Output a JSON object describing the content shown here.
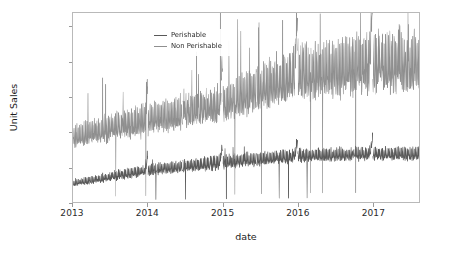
{
  "chart_data": {
    "type": "line",
    "title": "",
    "xlabel": "date",
    "ylabel": "Unit Sales",
    "grid": false,
    "legend_position": "upper-left-inside",
    "xlim": [
      "2013-01-01",
      "2017-08-15"
    ],
    "ylim": [
      0,
      1080000
    ],
    "yticks": [
      0,
      200000,
      400000,
      600000,
      800000,
      1000000
    ],
    "ytick_labels": [
      "0",
      "200000",
      "400000",
      "600000",
      "800000",
      "1000000"
    ],
    "xticks": [
      "2013",
      "2014",
      "2015",
      "2016",
      "2017"
    ],
    "xtick_labels": [
      "2013",
      "2014",
      "2015",
      "2016",
      "2017"
    ],
    "series": [
      {
        "name": "Perishable",
        "color": "#595959",
        "linewidth": 0.7,
        "description": "Daily perishable unit sales; low band rising in steps across years with occasional zero-drop gaps.",
        "yearly_band": [
          {
            "year": 2013,
            "low": 70000,
            "high": 125000,
            "mean": 95000
          },
          {
            "year": 2014,
            "low": 120000,
            "high": 215000,
            "mean": 165000
          },
          {
            "year": 2015,
            "low": 150000,
            "high": 265000,
            "mean": 205000
          },
          {
            "year": 2016,
            "low": 195000,
            "high": 300000,
            "mean": 248000
          },
          {
            "year": 2017,
            "low": 205000,
            "high": 310000,
            "mean": 262000
          }
        ]
      },
      {
        "name": "Non Perishable",
        "color": "#8f8f8f",
        "linewidth": 0.7,
        "description": "Daily non-perishable unit sales; upper band with large holiday spikes, rising through 2017.",
        "yearly_band": [
          {
            "year": 2013,
            "low": 255000,
            "high": 430000,
            "mean": 330000
          },
          {
            "year": 2014,
            "low": 300000,
            "high": 560000,
            "mean": 400000
          },
          {
            "year": 2015,
            "low": 360000,
            "high": 660000,
            "mean": 470000
          },
          {
            "year": 2016,
            "low": 430000,
            "high": 880000,
            "mean": 580000
          },
          {
            "year": 2017,
            "low": 450000,
            "high": 960000,
            "mean": 620000
          }
        ],
        "notable_spikes": [
          {
            "date": "2015-12-23",
            "value": 900000
          },
          {
            "date": "2016-04-20",
            "value": 1075000
          },
          {
            "date": "2016-12-23",
            "value": 960000
          },
          {
            "date": "2017-05-10",
            "value": 1015000
          }
        ]
      }
    ],
    "data_gaps": [
      "2014-01-01",
      "2014-06-20",
      "2014-12-25",
      "2015-01-01",
      "2015-06-15",
      "2016-01-01",
      "2017-01-01"
    ]
  },
  "legend": {
    "entries": [
      {
        "label": "Perishable"
      },
      {
        "label": "Non Perishable"
      }
    ]
  },
  "axes": {
    "y_title": "Unit Sales",
    "x_title": "date"
  }
}
